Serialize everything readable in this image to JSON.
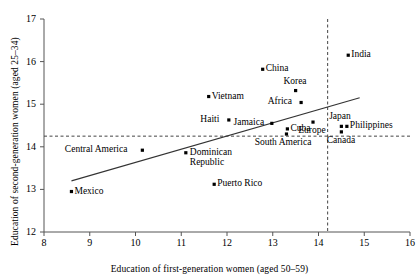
{
  "chart_data": {
    "type": "scatter",
    "title": "",
    "xlabel": "Education of first-generation women (aged 50–59)",
    "ylabel": "Education of second-generation women (aged 25–34)",
    "xlim": [
      8,
      16
    ],
    "ylim": [
      12,
      17
    ],
    "xticks": [
      8,
      9,
      10,
      11,
      12,
      13,
      14,
      15,
      16
    ],
    "yticks": [
      12,
      13,
      14,
      15,
      16,
      17
    ],
    "grid": false,
    "legend": null,
    "reference_lines": [
      {
        "name": "vertical-mean-line",
        "orientation": "vertical",
        "value": 14.2,
        "style": "dashed"
      },
      {
        "name": "horizontal-mean-line",
        "orientation": "horizontal",
        "value": 14.25,
        "style": "dashed"
      }
    ],
    "trend_line": {
      "name": "regression-line",
      "x": [
        8.6,
        14.9
      ],
      "y": [
        13.2,
        15.15
      ],
      "style": "solid"
    },
    "points": [
      {
        "label": "India",
        "x": 14.65,
        "y": 16.15,
        "label_pos": "right"
      },
      {
        "label": "China",
        "x": 12.78,
        "y": 15.82,
        "label_pos": "right"
      },
      {
        "label": "Korea",
        "x": 13.5,
        "y": 15.32,
        "label_pos": "above"
      },
      {
        "label": "Africa",
        "x": 13.62,
        "y": 15.04,
        "label_pos": "left"
      },
      {
        "label": "Vietnam",
        "x": 11.6,
        "y": 15.18,
        "label_pos": "right"
      },
      {
        "label": "Haiti",
        "x": 12.04,
        "y": 14.63,
        "label_pos": "left"
      },
      {
        "label": "Jamaica",
        "x": 12.98,
        "y": 14.55,
        "label_pos": "left"
      },
      {
        "label": "Cuba",
        "x": 13.32,
        "y": 14.42,
        "label_pos": "right"
      },
      {
        "label": "South America",
        "x": 13.3,
        "y": 14.3,
        "label_pos": "below"
      },
      {
        "label": "Europe",
        "x": 13.88,
        "y": 14.58,
        "label_pos": "below"
      },
      {
        "label": "Japan",
        "x": 14.5,
        "y": 14.48,
        "label_pos": "above"
      },
      {
        "label": "Philippines",
        "x": 14.62,
        "y": 14.48,
        "label_pos": "right"
      },
      {
        "label": "Canada",
        "x": 14.5,
        "y": 14.35,
        "label_pos": "below"
      },
      {
        "label": "Central America",
        "x": 10.15,
        "y": 13.92,
        "label_pos": "left"
      },
      {
        "label": "Dominican Republic",
        "x": 11.1,
        "y": 13.86,
        "label_pos": "right-wrap"
      },
      {
        "label": "Puerto Rico",
        "x": 11.72,
        "y": 13.12,
        "label_pos": "right"
      },
      {
        "label": "Mexico",
        "x": 8.6,
        "y": 12.95,
        "label_pos": "right"
      }
    ]
  },
  "axes": {
    "x_title": "Education of first-generation women (aged 50–59)",
    "y_title": "Education of second-generation women (aged 25–34)",
    "x_tick_labels": [
      "8",
      "9",
      "10",
      "11",
      "12",
      "13",
      "14",
      "15",
      "16"
    ],
    "y_tick_labels": [
      "12",
      "13",
      "14",
      "15",
      "16",
      "17"
    ]
  },
  "colors": {
    "marker": "#000000",
    "axis": "#555555",
    "trend": "#333333",
    "reference": "#444444",
    "background": "#ffffff"
  }
}
